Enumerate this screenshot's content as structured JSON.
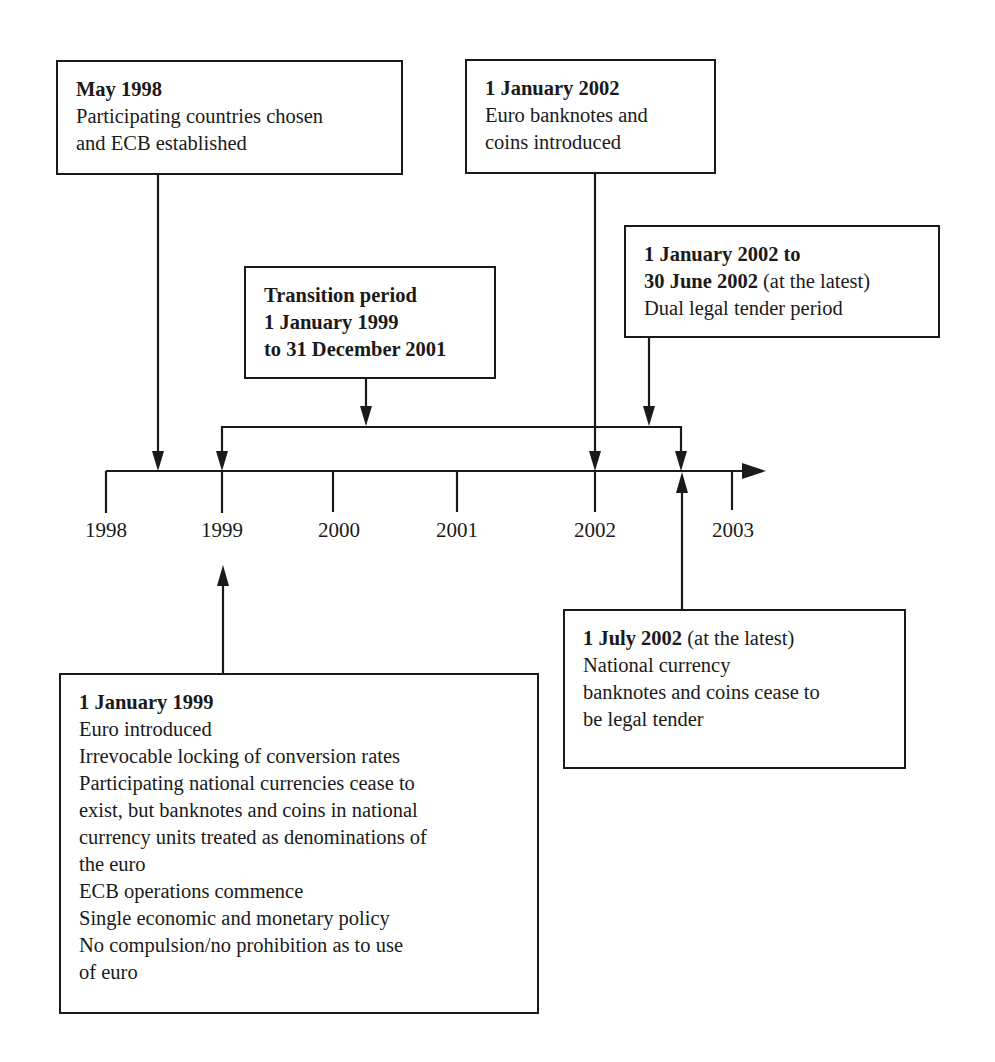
{
  "diagram": {
    "type": "timeline",
    "axis": {
      "years": [
        "1998",
        "1999",
        "2000",
        "2001",
        "2002",
        "2003"
      ]
    },
    "events": {
      "may1998": {
        "heading": "May 1998",
        "lines": [
          "Participating countries chosen",
          "and ECB established"
        ]
      },
      "jan2002": {
        "heading": "1 January 2002",
        "lines": [
          "Euro banknotes and",
          "coins introduced"
        ]
      },
      "dual": {
        "heading_line1": "1 January 2002 to",
        "heading_line2_bold": "30 June 2002",
        "heading_line2_rest": " (at the latest)",
        "lines": [
          "Dual legal tender period"
        ]
      },
      "transition": {
        "lines": [
          "Transition period",
          "1 January 1999",
          "to 31 December 2001"
        ]
      },
      "jan1999": {
        "heading": "1 January 1999",
        "lines": [
          "Euro introduced",
          "Irrevocable locking of conversion rates",
          "Participating national currencies cease to",
          "exist, but banknotes and coins in national",
          "currency units treated as denominations of",
          "the euro",
          "ECB operations commence",
          "Single economic and monetary policy",
          "No compulsion/no prohibition as to use",
          "of euro"
        ]
      },
      "jul2002": {
        "heading_bold": "1 July 2002",
        "heading_rest": " (at the latest)",
        "lines": [
          "National currency",
          "banknotes and coins cease to",
          "be legal tender"
        ]
      }
    }
  }
}
